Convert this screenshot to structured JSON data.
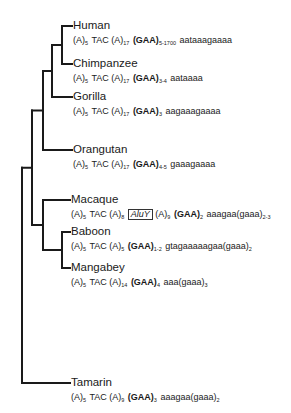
{
  "line_color": "#1a1a1a",
  "taxa": [
    {
      "name": "Human",
      "sequence": [
        {
          "t": "(A)"
        },
        {
          "sub": "5"
        },
        {
          "t": " TAC (A)"
        },
        {
          "sub": "17"
        },
        {
          "t": " "
        },
        {
          "b": "(GAA)"
        },
        {
          "sub": "5-1700"
        },
        {
          "t": " aataaagaaaa"
        }
      ]
    },
    {
      "name": "Chimpanzee",
      "sequence": [
        {
          "t": "(A)"
        },
        {
          "sub": "5"
        },
        {
          "t": " TAC (A)"
        },
        {
          "sub": "17"
        },
        {
          "t": " "
        },
        {
          "b": "(GAA)"
        },
        {
          "sub": "3-4"
        },
        {
          "t": " aataaaa"
        }
      ]
    },
    {
      "name": "Gorilla",
      "sequence": [
        {
          "t": "(A)"
        },
        {
          "sub": "5"
        },
        {
          "t": " TAC (A)"
        },
        {
          "sub": "17"
        },
        {
          "t": " "
        },
        {
          "b": "(GAA)"
        },
        {
          "sub": "3"
        },
        {
          "t": " aagaaagaaaa"
        }
      ]
    },
    {
      "name": "Orangutan",
      "sequence": [
        {
          "t": "(A)"
        },
        {
          "sub": "5"
        },
        {
          "t": " TAC (A)"
        },
        {
          "sub": "17"
        },
        {
          "t": " "
        },
        {
          "b": "(GAA)"
        },
        {
          "sub": "4-5"
        },
        {
          "t": " gaaagaaaa"
        }
      ]
    },
    {
      "name": "Macaque",
      "sequence": [
        {
          "t": "(A)"
        },
        {
          "sub": "5"
        },
        {
          "t": " TAC (A)"
        },
        {
          "sub": "8"
        },
        {
          "t": " "
        },
        {
          "box": "AluY"
        },
        {
          "t": " (A)"
        },
        {
          "sub": "9"
        },
        {
          "t": " "
        },
        {
          "b": "(GAA)"
        },
        {
          "sub": "2"
        },
        {
          "t": " aaagaa(gaaa)"
        },
        {
          "sub": "2-3"
        }
      ]
    },
    {
      "name": "Baboon",
      "sequence": [
        {
          "t": "(A)"
        },
        {
          "sub": "5"
        },
        {
          "t": " TAC (A)"
        },
        {
          "sub": "5"
        },
        {
          "t": " "
        },
        {
          "b": "(GAA)"
        },
        {
          "sub": "1-2"
        },
        {
          "t": " gtagaaaaagaa(gaaa)"
        },
        {
          "sub": "2"
        }
      ]
    },
    {
      "name": "Mangabey",
      "sequence": [
        {
          "t": "(A)"
        },
        {
          "sub": "5"
        },
        {
          "t": " TAC (A)"
        },
        {
          "sub": "14"
        },
        {
          "t": " "
        },
        {
          "b": "(GAA)"
        },
        {
          "sub": "4"
        },
        {
          "t": " aaa(gaaa)"
        },
        {
          "sub": "3"
        }
      ]
    },
    {
      "name": "Tamarin",
      "sequence": [
        {
          "t": "(A)"
        },
        {
          "sub": "5"
        },
        {
          "t": " TAC (A)"
        },
        {
          "sub": "9"
        },
        {
          "t": " "
        },
        {
          "b": "(GAA)"
        },
        {
          "sub": "3"
        },
        {
          "t": " aaagaa(gaaa)"
        },
        {
          "sub": "2"
        }
      ]
    }
  ]
}
